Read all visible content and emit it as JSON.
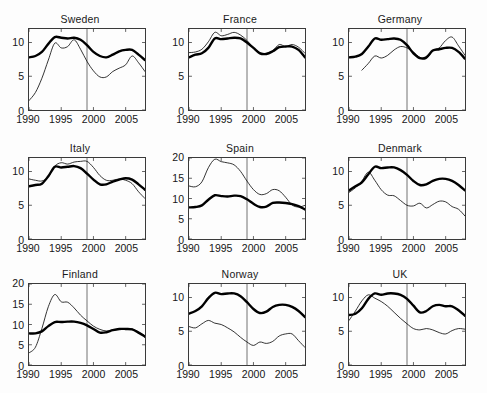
{
  "figure": {
    "type": "small-multiples-line-grid",
    "rows": 3,
    "cols": 3,
    "reference_line_x": 1999,
    "series_styles": [
      {
        "name": "thick-series",
        "width": "thick",
        "color": "#000000"
      },
      {
        "name": "thin-series",
        "width": "thin",
        "color": "#111111"
      }
    ]
  },
  "chart_data": [
    {
      "type": "line",
      "title": "Sweden",
      "xlabel": "",
      "ylabel": "",
      "xlim": [
        1990,
        2008
      ],
      "ylim": [
        0,
        12
      ],
      "xticks": [
        1990,
        1995,
        2000,
        2005
      ],
      "yticks": [
        0,
        5,
        10
      ],
      "grid": false,
      "legend": "none",
      "annotations": [
        {
          "type": "vline",
          "x": 1999
        }
      ],
      "x": [
        1990,
        1991,
        1992,
        1993,
        1994,
        1995,
        1996,
        1997,
        1998,
        1999,
        2000,
        2001,
        2002,
        2003,
        2004,
        2005,
        2006,
        2007,
        2008
      ],
      "series": [
        {
          "name": "thick-series",
          "values": [
            7.8,
            8.0,
            8.6,
            9.8,
            10.8,
            10.7,
            10.6,
            10.7,
            10.4,
            9.6,
            8.6,
            8.0,
            7.8,
            8.2,
            8.7,
            8.9,
            8.9,
            8.2,
            7.4
          ]
        },
        {
          "name": "thin-series",
          "values": [
            1.4,
            2.6,
            4.7,
            7.4,
            9.9,
            9.2,
            9.4,
            10.4,
            9.0,
            7.2,
            5.8,
            4.9,
            4.9,
            5.7,
            6.2,
            6.7,
            8.0,
            7.0,
            5.7
          ]
        }
      ]
    },
    {
      "type": "line",
      "title": "France",
      "xlabel": "",
      "ylabel": "",
      "xlim": [
        1990,
        2008
      ],
      "ylim": [
        0,
        12
      ],
      "xticks": [
        1990,
        1995,
        2000,
        2005
      ],
      "yticks": [
        0,
        5,
        10
      ],
      "grid": false,
      "legend": "none",
      "annotations": [
        {
          "type": "vline",
          "x": 1999
        }
      ],
      "x": [
        1990,
        1991,
        1992,
        1993,
        1994,
        1995,
        1996,
        1997,
        1998,
        1999,
        2000,
        2001,
        2002,
        2003,
        2004,
        2005,
        2006,
        2007,
        2008
      ],
      "series": [
        {
          "name": "thick-series",
          "values": [
            7.8,
            8.2,
            8.4,
            9.2,
            10.6,
            10.5,
            10.6,
            10.7,
            10.6,
            10.0,
            9.2,
            8.4,
            8.3,
            8.7,
            9.3,
            9.4,
            9.4,
            8.9,
            7.8
          ]
        },
        {
          "name": "thin-series",
          "values": [
            8.5,
            8.6,
            9.0,
            10.1,
            11.5,
            11.0,
            11.2,
            11.5,
            11.1,
            10.3,
            9.2,
            8.5,
            8.4,
            8.8,
            9.7,
            9.4,
            9.7,
            9.3,
            8.4
          ]
        }
      ]
    },
    {
      "type": "line",
      "title": "Germany",
      "xlabel": "",
      "ylabel": "",
      "xlim": [
        1990,
        2008
      ],
      "ylim": [
        0,
        12
      ],
      "xticks": [
        1990,
        1995,
        2000,
        2005
      ],
      "yticks": [
        0,
        5,
        10
      ],
      "grid": false,
      "legend": "none",
      "annotations": [
        {
          "type": "vline",
          "x": 1999
        }
      ],
      "x": [
        1990,
        1991,
        1992,
        1993,
        1994,
        1995,
        1996,
        1997,
        1998,
        1999,
        2000,
        2001,
        2002,
        2003,
        2004,
        2005,
        2006,
        2007,
        2008
      ],
      "series": [
        {
          "name": "thick-series",
          "values": [
            7.8,
            7.9,
            8.3,
            9.4,
            10.6,
            10.4,
            10.5,
            10.6,
            10.4,
            9.6,
            8.4,
            7.7,
            7.8,
            8.8,
            9.0,
            9.2,
            9.2,
            8.6,
            7.6
          ]
        },
        {
          "name": "thin-series",
          "values": [
            null,
            null,
            5.9,
            6.9,
            8.0,
            7.7,
            8.1,
            8.9,
            9.4,
            9.2,
            8.6,
            7.8,
            7.6,
            8.8,
            9.2,
            10.3,
            10.8,
            9.5,
            8.1
          ]
        }
      ]
    },
    {
      "type": "line",
      "title": "Italy",
      "xlabel": "",
      "ylabel": "",
      "xlim": [
        1990,
        2008
      ],
      "ylim": [
        0,
        12
      ],
      "xticks": [
        1990,
        1995,
        2000,
        2005
      ],
      "yticks": [
        0,
        5,
        10
      ],
      "grid": false,
      "legend": "none",
      "annotations": [
        {
          "type": "vline",
          "x": 1999
        }
      ],
      "x": [
        1990,
        1991,
        1992,
        1993,
        1994,
        1995,
        1996,
        1997,
        1998,
        1999,
        2000,
        2001,
        2002,
        2003,
        2004,
        2005,
        2006,
        2007,
        2008
      ],
      "series": [
        {
          "name": "thick-series",
          "values": [
            7.8,
            8.0,
            8.2,
            9.3,
            10.7,
            10.6,
            10.7,
            10.8,
            10.5,
            9.7,
            8.8,
            8.1,
            8.1,
            8.5,
            8.8,
            9.0,
            8.8,
            8.1,
            7.3
          ]
        },
        {
          "name": "thin-series",
          "values": [
            8.9,
            8.7,
            8.6,
            9.2,
            10.8,
            11.3,
            11.1,
            11.4,
            11.5,
            11.5,
            10.6,
            9.4,
            8.7,
            8.7,
            8.9,
            8.7,
            8.2,
            7.0,
            6.0
          ]
        }
      ]
    },
    {
      "type": "line",
      "title": "Spain",
      "xlabel": "",
      "ylabel": "",
      "xlim": [
        1990,
        2008
      ],
      "ylim": [
        0,
        20
      ],
      "xticks": [
        1990,
        1995,
        2000,
        2005
      ],
      "yticks": [
        0,
        5,
        10,
        15,
        20
      ],
      "grid": false,
      "legend": "none",
      "annotations": [
        {
          "type": "vline",
          "x": 1999
        }
      ],
      "x": [
        1990,
        1991,
        1992,
        1993,
        1994,
        1995,
        1996,
        1997,
        1998,
        1999,
        2000,
        2001,
        2002,
        2003,
        2004,
        2005,
        2006,
        2007,
        2008
      ],
      "series": [
        {
          "name": "thick-series",
          "values": [
            7.8,
            7.9,
            8.3,
            9.7,
            10.8,
            10.6,
            10.5,
            10.7,
            10.6,
            9.8,
            8.7,
            7.9,
            8.0,
            8.9,
            9.0,
            8.9,
            8.6,
            8.1,
            7.3
          ]
        },
        {
          "name": "thin-series",
          "values": [
            13.1,
            12.9,
            14.1,
            17.6,
            19.7,
            19.1,
            18.8,
            18.3,
            16.7,
            14.3,
            12.2,
            11.0,
            11.2,
            12.2,
            11.9,
            10.3,
            8.4,
            7.9,
            8.3
          ]
        }
      ]
    },
    {
      "type": "line",
      "title": "Denmark",
      "xlabel": "",
      "ylabel": "",
      "xlim": [
        1990,
        2008
      ],
      "ylim": [
        0,
        12
      ],
      "xticks": [
        1990,
        1995,
        2000,
        2005
      ],
      "yticks": [
        0,
        5,
        10
      ],
      "grid": false,
      "legend": "none",
      "annotations": [
        {
          "type": "vline",
          "x": 1999
        }
      ],
      "x": [
        1990,
        1991,
        1992,
        1993,
        1994,
        1995,
        1996,
        1997,
        1998,
        1999,
        2000,
        2001,
        2002,
        2003,
        2004,
        2005,
        2006,
        2007,
        2008
      ],
      "series": [
        {
          "name": "thick-series",
          "values": [
            7.2,
            7.8,
            8.4,
            9.6,
            10.7,
            10.5,
            10.6,
            10.6,
            10.2,
            9.5,
            8.6,
            8.0,
            8.1,
            8.6,
            8.9,
            8.9,
            8.6,
            8.0,
            7.2
          ]
        },
        {
          "name": "thin-series",
          "values": [
            6.9,
            7.6,
            8.6,
            9.9,
            8.7,
            7.3,
            6.5,
            6.4,
            5.7,
            5.0,
            4.9,
            5.3,
            4.6,
            5.1,
            5.6,
            5.5,
            4.8,
            4.4,
            3.4
          ]
        }
      ]
    },
    {
      "type": "line",
      "title": "Finland",
      "xlabel": "",
      "ylabel": "",
      "xlim": [
        1990,
        2008
      ],
      "ylim": [
        0,
        20
      ],
      "xticks": [
        1990,
        1995,
        2000,
        2005
      ],
      "yticks": [
        0,
        5,
        10,
        15,
        20
      ],
      "grid": false,
      "legend": "none",
      "annotations": [
        {
          "type": "vline",
          "x": 1999
        }
      ],
      "x": [
        1990,
        1991,
        1992,
        1993,
        1994,
        1995,
        1996,
        1997,
        1998,
        1999,
        2000,
        2001,
        2002,
        2003,
        2004,
        2005,
        2006,
        2007,
        2008
      ],
      "series": [
        {
          "name": "thick-series",
          "values": [
            7.8,
            7.8,
            8.3,
            9.6,
            10.6,
            10.6,
            10.7,
            10.7,
            10.4,
            9.8,
            8.9,
            8.0,
            8.1,
            8.6,
            8.9,
            8.9,
            8.8,
            8.0,
            7.0
          ]
        },
        {
          "name": "thin-series",
          "values": [
            3.0,
            4.4,
            9.0,
            14.4,
            17.4,
            15.6,
            15.5,
            14.1,
            12.3,
            10.9,
            9.6,
            8.8,
            8.4,
            8.6,
            8.9,
            8.9,
            8.9,
            8.1,
            7.2
          ]
        }
      ]
    },
    {
      "type": "line",
      "title": "Norway",
      "xlabel": "",
      "ylabel": "",
      "xlim": [
        1990,
        2008
      ],
      "ylim": [
        0,
        12
      ],
      "xticks": [
        1990,
        1995,
        2000,
        2005
      ],
      "yticks": [
        0,
        5,
        10
      ],
      "grid": false,
      "legend": "none",
      "annotations": [
        {
          "type": "vline",
          "x": 1999
        }
      ],
      "x": [
        1990,
        1991,
        1992,
        1993,
        1994,
        1995,
        1996,
        1997,
        1998,
        1999,
        2000,
        2001,
        2002,
        2003,
        2004,
        2005,
        2006,
        2007,
        2008
      ],
      "series": [
        {
          "name": "thick-series",
          "values": [
            7.6,
            8.0,
            8.7,
            9.9,
            10.7,
            10.5,
            10.6,
            10.6,
            10.2,
            9.3,
            8.3,
            7.7,
            7.9,
            8.6,
            8.9,
            8.9,
            8.6,
            8.0,
            7.1
          ]
        },
        {
          "name": "thin-series",
          "values": [
            5.7,
            5.5,
            6.1,
            6.6,
            6.2,
            6.0,
            5.5,
            4.9,
            4.1,
            3.4,
            2.9,
            3.4,
            3.2,
            3.5,
            4.3,
            4.6,
            4.6,
            3.6,
            2.6
          ]
        }
      ]
    },
    {
      "type": "line",
      "title": "UK",
      "xlabel": "",
      "ylabel": "",
      "xlim": [
        1990,
        2008
      ],
      "ylim": [
        0,
        12
      ],
      "xticks": [
        1990,
        1995,
        2000,
        2005
      ],
      "yticks": [
        0,
        5,
        10
      ],
      "grid": false,
      "legend": "none",
      "annotations": [
        {
          "type": "vline",
          "x": 1999
        }
      ],
      "x": [
        1990,
        1991,
        1992,
        1993,
        1994,
        1995,
        1996,
        1997,
        1998,
        1999,
        2000,
        2001,
        2002,
        2003,
        2004,
        2005,
        2006,
        2007,
        2008
      ],
      "series": [
        {
          "name": "thick-series",
          "values": [
            7.4,
            7.6,
            8.4,
            9.8,
            10.6,
            10.4,
            10.6,
            10.6,
            10.4,
            9.8,
            8.8,
            7.8,
            8.0,
            8.7,
            8.9,
            8.7,
            8.7,
            8.1,
            7.3
          ]
        },
        {
          "name": "thin-series",
          "values": [
            6.6,
            8.0,
            9.5,
            10.4,
            9.9,
            9.4,
            8.7,
            7.8,
            6.9,
            6.1,
            5.4,
            5.2,
            5.4,
            5.2,
            4.8,
            4.6,
            5.1,
            5.4,
            5.3
          ]
        }
      ]
    }
  ]
}
